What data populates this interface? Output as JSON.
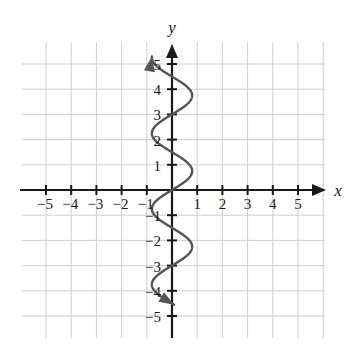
{
  "figure": {
    "kind": "cartesian-graph",
    "background": "#ffffff",
    "ink_color": "#2b2b2b",
    "grid_color": "#cfcfcf",
    "axis_color": "#1a1a1a",
    "curve_color": "#555555"
  },
  "axes": {
    "x_label": "x",
    "y_label": "y",
    "x_tick_labels": [
      "−5",
      "−4",
      "−3",
      "−2",
      "−1",
      "1",
      "2",
      "3",
      "4",
      "5"
    ],
    "x_tick_values": [
      -5,
      -4,
      -3,
      -2,
      -1,
      1,
      2,
      3,
      4,
      5
    ],
    "y_tick_labels": [
      "5",
      "4",
      "3",
      "2",
      "1",
      "−1",
      "−2",
      "−3",
      "−4",
      "−5"
    ],
    "y_tick_values": [
      5,
      4,
      3,
      2,
      1,
      -1,
      -2,
      -3,
      -4,
      -5
    ],
    "xlim": [
      -6,
      6.1
    ],
    "ylim": [
      -5.9,
      5.9
    ],
    "grid": true,
    "x_arrow": true,
    "y_arrow": true
  },
  "chart_data": {
    "type": "line",
    "title": "",
    "xlabel": "x",
    "ylabel": "y",
    "xlim": [
      -6,
      6.1
    ],
    "ylim": [
      -5.9,
      5.9
    ],
    "grid": true,
    "legend": "none",
    "orientation": "x-as-function-of-y",
    "equation_form": "x = A sin(2*pi*y/period)",
    "amplitude": 0.8,
    "period": 3,
    "y_start": -4.55,
    "y_end": 5.3,
    "arrow_start": "down-right",
    "arrow_end": "up-left",
    "y_axis_crossings": [
      -4.5,
      -3,
      -1.5,
      0,
      1.5,
      3,
      4.5
    ],
    "points": [
      {
        "y": -4.55,
        "x": 0.45
      },
      {
        "y": -4.4,
        "x": 0.2
      },
      {
        "y": -4.2,
        "x": -0.25
      },
      {
        "y": -4.0,
        "x": -0.6
      },
      {
        "y": -3.75,
        "x": -0.8
      },
      {
        "y": -3.5,
        "x": -0.72
      },
      {
        "y": -3.25,
        "x": -0.45
      },
      {
        "y": -3.0,
        "x": 0.0
      },
      {
        "y": -2.75,
        "x": 0.45
      },
      {
        "y": -2.5,
        "x": 0.72
      },
      {
        "y": -2.25,
        "x": 0.8
      },
      {
        "y": -2.0,
        "x": 0.72
      },
      {
        "y": -1.75,
        "x": 0.45
      },
      {
        "y": -1.5,
        "x": 0.0
      },
      {
        "y": -1.25,
        "x": -0.45
      },
      {
        "y": -1.0,
        "x": -0.72
      },
      {
        "y": -0.75,
        "x": -0.8
      },
      {
        "y": -0.5,
        "x": -0.72
      },
      {
        "y": -0.25,
        "x": -0.45
      },
      {
        "y": 0.0,
        "x": 0.0
      },
      {
        "y": 0.25,
        "x": 0.45
      },
      {
        "y": 0.5,
        "x": 0.72
      },
      {
        "y": 0.75,
        "x": 0.8
      },
      {
        "y": 1.0,
        "x": 0.72
      },
      {
        "y": 1.25,
        "x": 0.45
      },
      {
        "y": 1.5,
        "x": 0.0
      },
      {
        "y": 1.75,
        "x": -0.45
      },
      {
        "y": 2.0,
        "x": -0.72
      },
      {
        "y": 2.25,
        "x": -0.8
      },
      {
        "y": 2.5,
        "x": -0.72
      },
      {
        "y": 2.75,
        "x": -0.45
      },
      {
        "y": 3.0,
        "x": 0.0
      },
      {
        "y": 3.25,
        "x": 0.45
      },
      {
        "y": 3.5,
        "x": 0.72
      },
      {
        "y": 3.75,
        "x": 0.8
      },
      {
        "y": 4.0,
        "x": 0.72
      },
      {
        "y": 4.25,
        "x": 0.45
      },
      {
        "y": 4.5,
        "x": 0.0
      },
      {
        "y": 4.75,
        "x": -0.45
      },
      {
        "y": 5.0,
        "x": -0.72
      },
      {
        "y": 5.3,
        "x": -0.82
      }
    ]
  }
}
